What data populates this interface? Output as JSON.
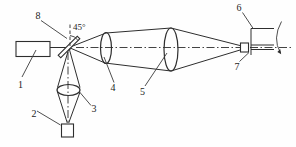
{
  "diagram": {
    "labels": {
      "n1": "1",
      "n2": "2",
      "n3": "3",
      "n4": "4",
      "n5": "5",
      "n6": "6",
      "n7": "7",
      "n8": "8",
      "angle": "45°"
    },
    "colors": {
      "ink": "#2e2e2e",
      "background": "#ffffff"
    }
  }
}
